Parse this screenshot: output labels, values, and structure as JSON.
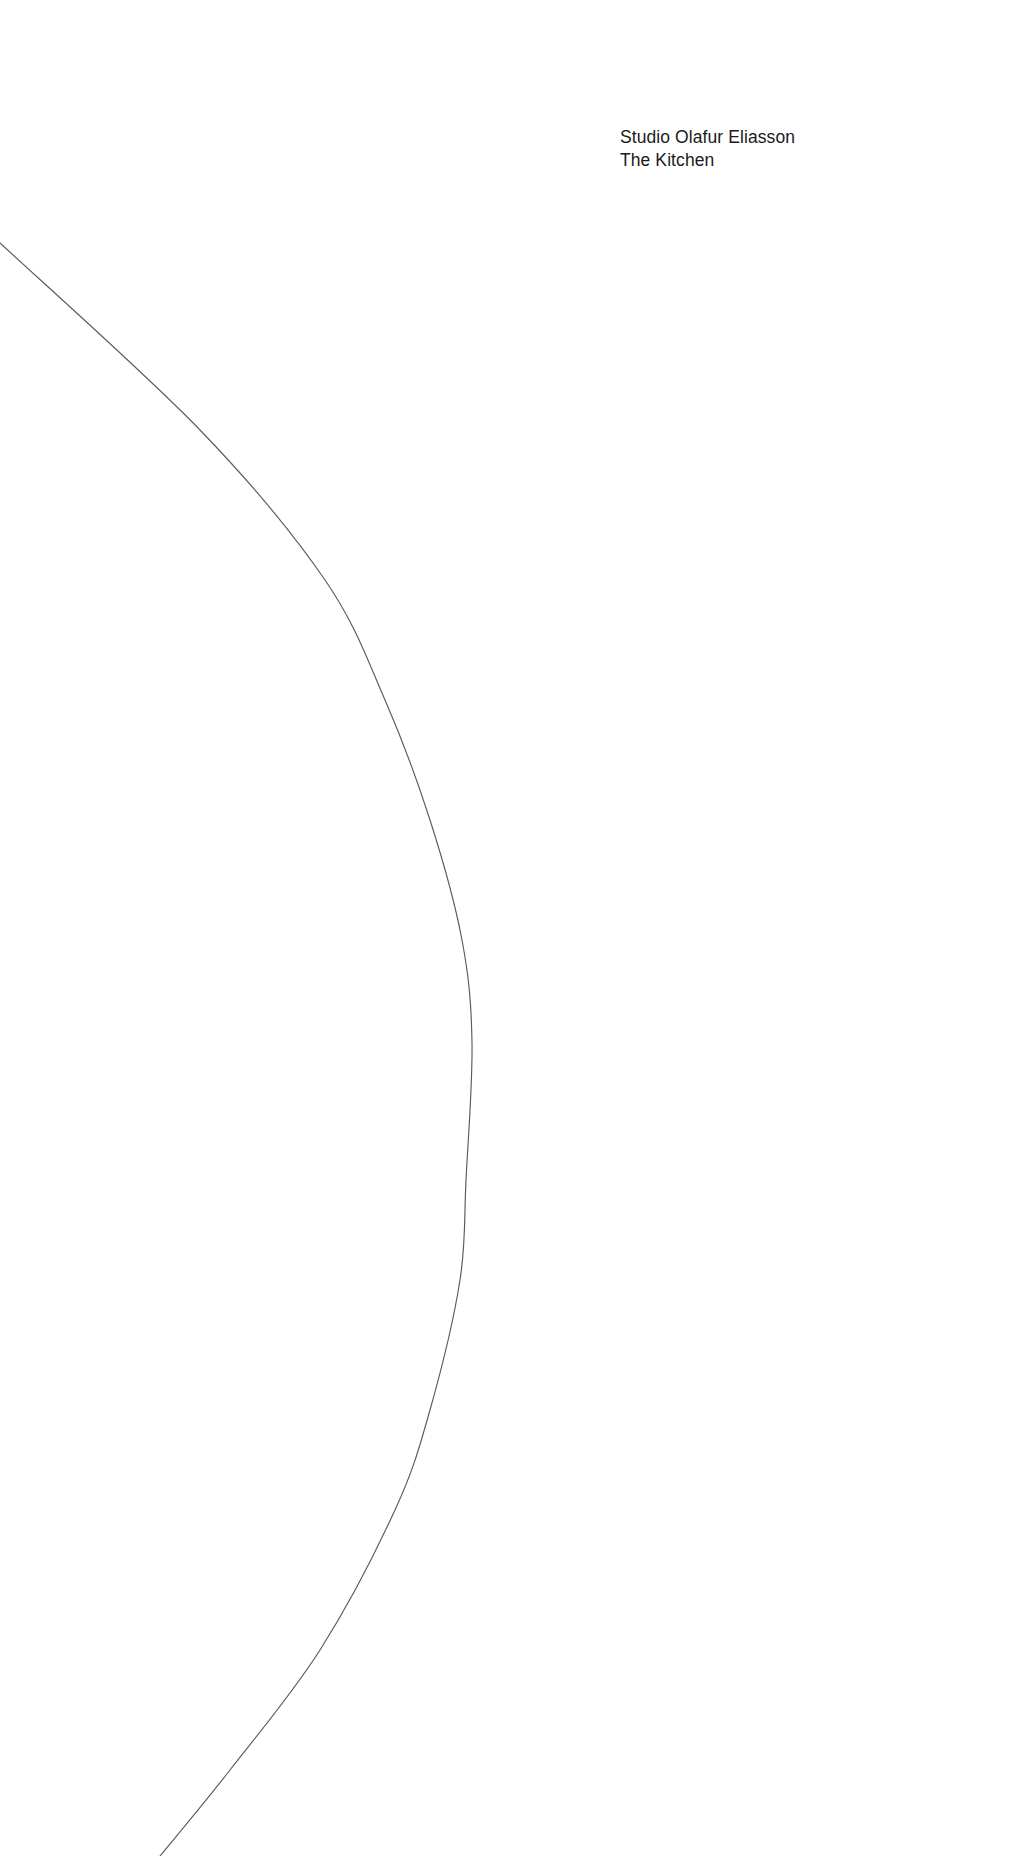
{
  "page": {
    "width": 1009,
    "height": 1856,
    "background_color": "#ffffff"
  },
  "titleblock": {
    "name": "studio-olafur-eliasson-the-kitchen",
    "lines": [
      "Studio Olafur Eliasson",
      "The Kitchen"
    ],
    "line1": "Studio Olafur Eliasson",
    "line2": "The Kitchen",
    "text_color": "#1a1a1a",
    "align": "left",
    "position": "top-right"
  },
  "artwork": {
    "name": "thin-arc-line",
    "type": "circular-arc",
    "stroke_color": "#5a5a5c",
    "stroke_width_px": 1.15,
    "fill": "none",
    "description": "single hairline circular arc bulging toward the right",
    "geometry": {
      "center_x": -400,
      "center_y": 1040,
      "radius": 872,
      "enters_left_edge_at_y": 243,
      "apex_point": [
        472,
        1043
      ],
      "exits_bottom_edge_at_x": 160
    },
    "sampled_points": [
      [
        0,
        243
      ],
      [
        200,
        430
      ],
      [
        325,
        580
      ],
      [
        385,
        700
      ],
      [
        430,
        820
      ],
      [
        462,
        940
      ],
      [
        472,
        1043
      ],
      [
        466,
        1180
      ],
      [
        460,
        1280
      ],
      [
        430,
        1410
      ],
      [
        395,
        1510
      ],
      [
        320,
        1650
      ],
      [
        230,
        1770
      ],
      [
        160,
        1856
      ]
    ]
  }
}
